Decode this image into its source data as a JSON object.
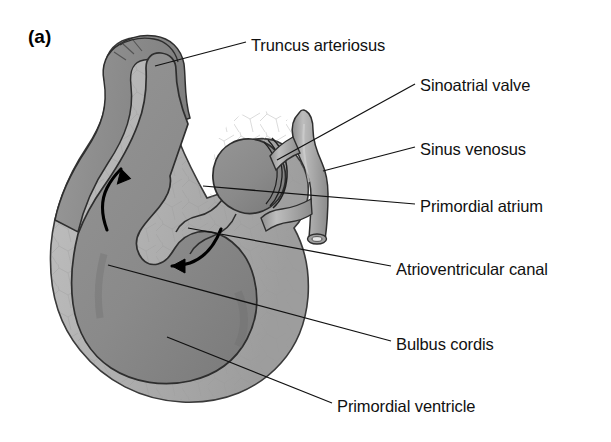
{
  "figure": {
    "panel_label": "(a)",
    "colors": {
      "background": "#ffffff",
      "outer_wall": "#b3b3b3",
      "outer_wall_shade": "#a2a2a2",
      "chamber_fill": "#8c8c8c",
      "chamber_shade": "#7d7d7d",
      "vessel_fill": "#a8a8a8",
      "outline": "#2a2a2a",
      "leader_line": "#111111",
      "arrow": "#000000",
      "text": "#111111"
    }
  },
  "labels": [
    {
      "id": "truncus-arteriosus",
      "text": "Truncus arteriosus",
      "x": 251,
      "y": 36,
      "leader": [
        [
          246,
          42
        ],
        [
          155,
          66
        ]
      ]
    },
    {
      "id": "sinoatrial-valve",
      "text": "Sinoatrial valve",
      "x": 420,
      "y": 76,
      "leader": [
        [
          415,
          84
        ],
        [
          277,
          160
        ]
      ]
    },
    {
      "id": "sinus-venosus",
      "text": "Sinus venosus",
      "x": 420,
      "y": 140,
      "leader": [
        [
          415,
          147
        ],
        [
          323,
          171
        ]
      ]
    },
    {
      "id": "primordial-atrium",
      "text": "Primordial atrium",
      "x": 420,
      "y": 197,
      "leader": [
        [
          415,
          204
        ],
        [
          203,
          186
        ]
      ]
    },
    {
      "id": "atrioventricular-canal",
      "text": "Atrioventricular canal",
      "x": 396,
      "y": 260,
      "leader": [
        [
          391,
          266
        ],
        [
          188,
          228
        ]
      ]
    },
    {
      "id": "bulbus-cordis",
      "text": "Bulbus cordis",
      "x": 396,
      "y": 335,
      "leader": [
        [
          391,
          341
        ],
        [
          108,
          265
        ]
      ]
    },
    {
      "id": "primordial-ventricle",
      "text": "Primordial ventricle",
      "x": 337,
      "y": 397,
      "leader": [
        [
          332,
          403
        ],
        [
          167,
          337
        ]
      ]
    }
  ],
  "flow_arrows": [
    {
      "id": "outflow-arrow-up",
      "direction": "up",
      "description": "blood flow upward through bulbus cordis into truncus arteriosus"
    },
    {
      "id": "inflow-arrow-left",
      "direction": "left",
      "description": "blood flow from atrium through atrioventricular canal into ventricle"
    }
  ]
}
